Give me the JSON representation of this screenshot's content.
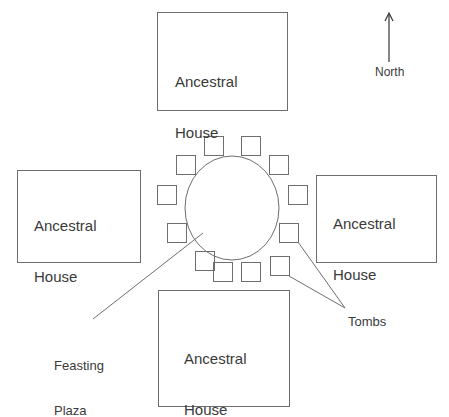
{
  "diagram": {
    "colors": {
      "stroke": "#6e6e6e",
      "text": "#3a3a3a",
      "background": "#ffffff"
    },
    "compass": {
      "label": "North",
      "icon": "north-arrow-icon"
    },
    "houses": [
      {
        "id": "north",
        "label_line1": "Ancestral",
        "label_line2": "House"
      },
      {
        "id": "west",
        "label_line1": "Ancestral",
        "label_line2": "House"
      },
      {
        "id": "east",
        "label_line1": "Ancestral",
        "label_line2": "House"
      },
      {
        "id": "south",
        "label_line1": "Ancestral",
        "label_line2": "House"
      }
    ],
    "plaza": {
      "label_line1": "Feasting",
      "label_line2": "Plaza"
    },
    "tombs": {
      "label": "Tombs",
      "count": 12
    }
  }
}
